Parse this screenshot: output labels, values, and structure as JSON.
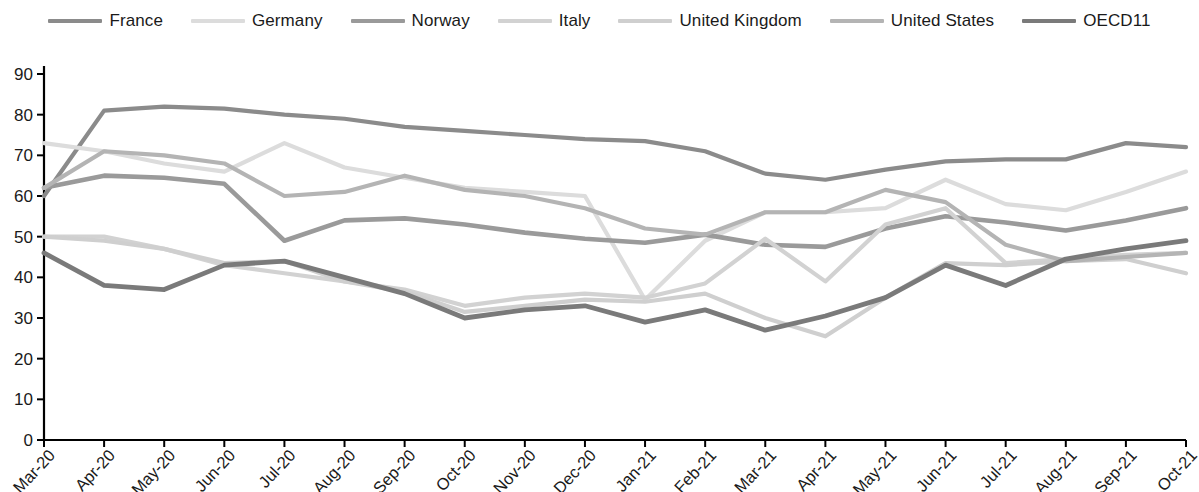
{
  "legend": {
    "position": "top-center",
    "items": [
      {
        "label": "France",
        "color": "#8b8b8b"
      },
      {
        "label": "Germany",
        "color": "#dcdcdc"
      },
      {
        "label": "Norway",
        "color": "#9a9a9a"
      },
      {
        "label": "Italy",
        "color": "#d2d2d2"
      },
      {
        "label": "United Kingdom",
        "color": "#cfcfcf"
      },
      {
        "label": "United States",
        "color": "#b4b4b4"
      },
      {
        "label": "OECD11",
        "color": "#7a7a7a"
      }
    ]
  },
  "axes": {
    "y_ticks": [
      "0",
      "10",
      "20",
      "30",
      "40",
      "50",
      "60",
      "70",
      "80",
      "90"
    ],
    "x_ticks": [
      "Mar-20",
      "Apr-20",
      "May-20",
      "Jun-20",
      "Jul-20",
      "Aug-20",
      "Sep-20",
      "Oct-20",
      "Nov-20",
      "Dec-20",
      "Jan-21",
      "Feb-21",
      "Mar-21",
      "Apr-21",
      "May-21",
      "Jun-21",
      "Jul-21",
      "Aug-21",
      "Sep-21",
      "Oct-21"
    ]
  },
  "chart_data": {
    "type": "line",
    "title": "",
    "subtitle": "",
    "xlabel": "",
    "ylabel": "",
    "ylim": [
      0,
      90
    ],
    "ytick_step": 10,
    "grid": false,
    "legend_position": "top-center",
    "categories": [
      "Mar-20",
      "Apr-20",
      "May-20",
      "Jun-20",
      "Jul-20",
      "Aug-20",
      "Sep-20",
      "Oct-20",
      "Nov-20",
      "Dec-20",
      "Jan-21",
      "Feb-21",
      "Mar-21",
      "Apr-21",
      "May-21",
      "Jun-21",
      "Jul-21",
      "Aug-21",
      "Sep-21",
      "Oct-21"
    ],
    "series": [
      {
        "name": "France",
        "color": "#8b8b8b",
        "width": 4.2,
        "values": [
          60,
          81,
          82,
          81.5,
          80,
          79,
          77,
          76,
          75,
          74,
          73.5,
          71,
          65.5,
          64,
          66.5,
          68.5,
          69,
          69,
          73,
          72
        ]
      },
      {
        "name": "Germany",
        "color": "#dcdcdc",
        "width": 4.2,
        "values": [
          73,
          71,
          68,
          66,
          73,
          67,
          64.5,
          62,
          61,
          60,
          34.5,
          49,
          56,
          56,
          57,
          64,
          58,
          56.5,
          61,
          66
        ]
      },
      {
        "name": "Norway",
        "color": "#9a9a9a",
        "width": 4.6,
        "values": [
          62,
          65,
          64.5,
          63,
          49,
          54,
          54.5,
          53,
          51,
          49.5,
          48.5,
          50.5,
          48,
          47.5,
          52,
          55,
          53.5,
          51.5,
          54,
          57
        ]
      },
      {
        "name": "Italy",
        "color": "#d2d2d2",
        "width": 4.2,
        "values": [
          50,
          50,
          47,
          43,
          41,
          39,
          37,
          33,
          35,
          36,
          35,
          38.5,
          49.5,
          39,
          53,
          57,
          43.5,
          44.5,
          45.5,
          46
        ]
      },
      {
        "name": "United Kingdom",
        "color": "#cfcfcf",
        "width": 4.2,
        "values": [
          50,
          49,
          47,
          43.5,
          44,
          39,
          36.5,
          31.5,
          33,
          34.5,
          34,
          36,
          30,
          25.5,
          35,
          43.5,
          43,
          44,
          44.5,
          41
        ]
      },
      {
        "name": "United States",
        "color": "#b4b4b4",
        "width": 4.2,
        "values": [
          62,
          71,
          70,
          68,
          60,
          61,
          65,
          61.5,
          60,
          57,
          52,
          50.5,
          56,
          56,
          61.5,
          58.5,
          48,
          44,
          45,
          46
        ]
      },
      {
        "name": "OECD11",
        "color": "#7a7a7a",
        "width": 4.8,
        "values": [
          46,
          38,
          37,
          43,
          44,
          40,
          36,
          30,
          32,
          33,
          29,
          32,
          27,
          30.5,
          35,
          43,
          38,
          44.5,
          47,
          49
        ]
      }
    ]
  }
}
